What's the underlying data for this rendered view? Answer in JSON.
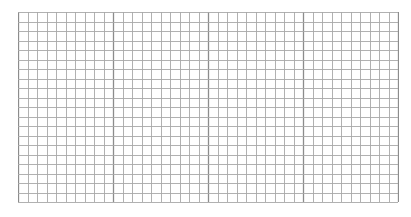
{
  "grid": {
    "columns": 40,
    "rows": 20,
    "cell_size_px": 9.5,
    "major_every_columns": 10,
    "line_color": "#a8a8a8",
    "major_line_color": "#8c8c8c",
    "background": "#ffffff"
  }
}
